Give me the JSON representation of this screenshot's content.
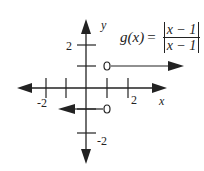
{
  "diagram": {
    "type": "piecewise-function-graph",
    "function_name": "g(x)",
    "equals": "=",
    "numerator": "x − 1",
    "denominator": "x − 1",
    "axes": {
      "x_label": "x",
      "y_label": "y",
      "x_ticks": [
        -2,
        -1,
        1,
        2
      ],
      "y_ticks": [
        2,
        1,
        -1,
        -2
      ],
      "x_tick_labels": [
        "-2",
        "2"
      ],
      "y_tick_labels": [
        "2",
        "-2"
      ]
    },
    "pieces": [
      {
        "y": 1,
        "domain": "x > 1",
        "open_circle_at": [
          1,
          1
        ],
        "direction": "right"
      },
      {
        "y": -1,
        "domain": "x < 1",
        "open_circle_at": [
          1,
          -1
        ],
        "direction": "left"
      }
    ],
    "colors": {
      "ink": "#222222",
      "background": "#ffffff"
    }
  },
  "labels": {
    "x_axis": "x",
    "y_axis": "y",
    "tick_x_neg2": "-2",
    "tick_x_2": "2",
    "tick_y_2": "2",
    "tick_y_neg2": "-2"
  },
  "formula": {
    "lhs": "g(x)",
    "eq": "=",
    "num": "x − 1",
    "den": "x − 1"
  }
}
